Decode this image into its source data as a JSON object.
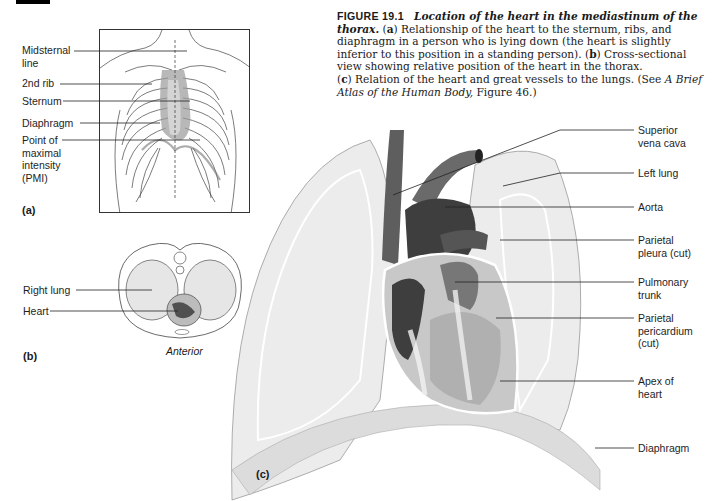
{
  "caption": {
    "figure_number": "FIGURE 19.1",
    "title": "Location of the heart in the mediastinum of the thorax.",
    "a_tag": "a",
    "a_text": "Relationship of the heart to the sternum, ribs, and diaphragm in a person who is lying down (the heart is slightly inferior to this position in a standing person).",
    "b_tag": "b",
    "b_text": "Cross-sectional view showing relative position of the heart in the thorax.",
    "c_tag": "c",
    "c_text": "Relation of the heart and great vessels to the lungs. (See",
    "ref_italic": "A Brief Atlas of the Human Body,",
    "ref_tail": "Figure 46.)"
  },
  "panel_a": {
    "tag": "(a)",
    "labels": [
      {
        "id": "midsternal-line",
        "lines": [
          "Midsternal",
          "line"
        ]
      },
      {
        "id": "2nd-rib",
        "lines": [
          "2nd rib"
        ]
      },
      {
        "id": "sternum",
        "lines": [
          "Sternum"
        ]
      },
      {
        "id": "diaphragm",
        "lines": [
          "Diaphragm"
        ]
      },
      {
        "id": "pmi",
        "lines": [
          "Point of",
          "maximal",
          "intensity",
          "(PMI)"
        ]
      }
    ]
  },
  "panel_b": {
    "tag": "(b)",
    "orientation": "Anterior",
    "labels": [
      {
        "id": "right-lung",
        "lines": [
          "Right lung"
        ]
      },
      {
        "id": "heart",
        "lines": [
          "Heart"
        ]
      }
    ]
  },
  "panel_c": {
    "tag": "(c)",
    "labels": [
      {
        "id": "superior-vena-cava",
        "lines": [
          "Superior",
          "vena cava"
        ]
      },
      {
        "id": "left-lung",
        "lines": [
          "Left lung"
        ]
      },
      {
        "id": "aorta",
        "lines": [
          "Aorta"
        ]
      },
      {
        "id": "parietal-pleura",
        "lines": [
          "Parietal",
          "pleura (cut)"
        ]
      },
      {
        "id": "pulmonary-trunk",
        "lines": [
          "Pulmonary",
          "trunk"
        ]
      },
      {
        "id": "parietal-pericardium",
        "lines": [
          "Parietal",
          "pericardium",
          "(cut)"
        ]
      },
      {
        "id": "apex-of-heart",
        "lines": [
          "Apex of",
          "heart"
        ]
      },
      {
        "id": "diaphragm-c",
        "lines": [
          "Diaphragm"
        ]
      }
    ]
  },
  "colors": {
    "ink": "#1e1e1e",
    "lung_fill": "#e9e9e9",
    "heart_dark": "#4a4a4a",
    "vessel": "#5a5a5a"
  }
}
